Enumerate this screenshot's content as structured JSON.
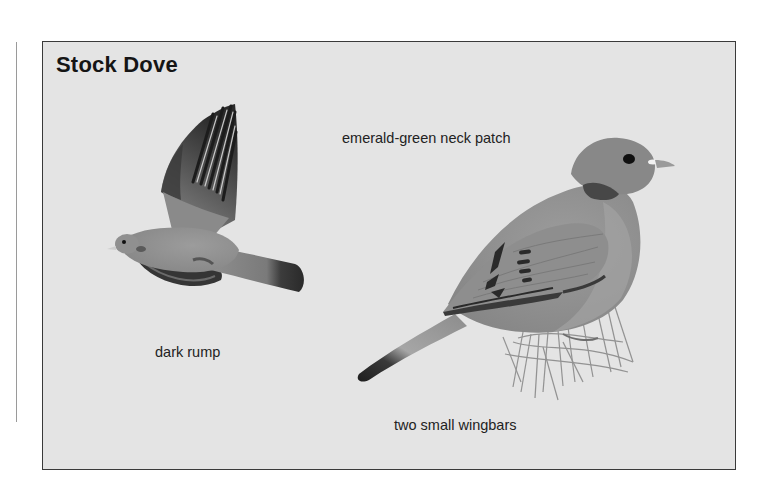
{
  "plate": {
    "title": "Stock Dove",
    "background_color": "#e4e4e4",
    "border_color": "#3a3a3a"
  },
  "illustrations": [
    {
      "name": "flying-stock-dove",
      "label": "dark rump"
    },
    {
      "name": "perched-stock-dove",
      "labels": [
        "emerald-green neck patch",
        "two small wingbars"
      ]
    }
  ],
  "labels": {
    "neck_patch": "emerald-green neck patch",
    "rump": "dark rump",
    "wingbars": "two small wingbars"
  }
}
